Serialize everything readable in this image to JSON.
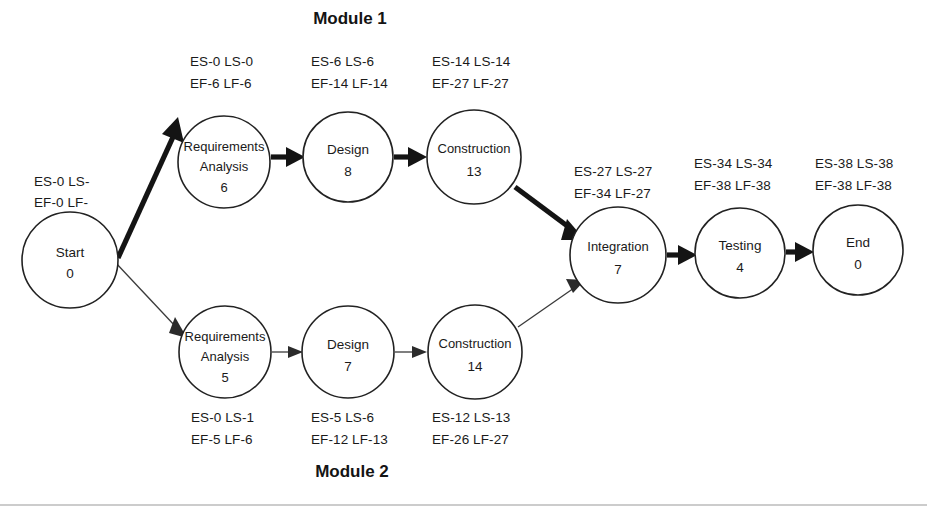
{
  "diagram": {
    "type": "pert-cpm-network",
    "module_titles": {
      "top": "Module 1",
      "bottom": "Module 2"
    },
    "nodes": [
      {
        "id": "start",
        "name": "Start",
        "duration": "0",
        "label_line1": "ES-0 LS-",
        "label_line2": "EF-0 LF-",
        "cx": 70,
        "cy": 260,
        "r": 48,
        "label_x": 34,
        "label_y": 182
      },
      {
        "id": "req-analysis-1",
        "name": "Requirements",
        "name2": "Analysis",
        "duration": "6",
        "label_line1": "ES-0 LS-0",
        "label_line2": "EF-6 LF-6",
        "cx": 224,
        "cy": 162,
        "r": 46,
        "label_x": 190,
        "label_y": 62
      },
      {
        "id": "design-1",
        "name": "Design",
        "duration": "8",
        "label_line1": "ES-6 LS-6",
        "label_line2": "EF-14 LF-14",
        "cx": 348,
        "cy": 157,
        "r": 45,
        "label_x": 311,
        "label_y": 62
      },
      {
        "id": "construction-1",
        "name": "Construction",
        "duration": "13",
        "label_line1": "ES-14 LS-14",
        "label_line2": "EF-27 LF-27",
        "cx": 474,
        "cy": 157,
        "r": 47,
        "label_x": 432,
        "label_y": 62
      },
      {
        "id": "req-analysis-2",
        "name": "Requirements",
        "name2": "Analysis",
        "duration": "5",
        "label_line1": "ES-0 LS-1",
        "label_line2": "EF-5 LF-6",
        "cx": 225,
        "cy": 352,
        "r": 46,
        "label_x": 191,
        "label_y": 418
      },
      {
        "id": "design-2",
        "name": "Design",
        "duration": "7",
        "label_line1": "ES-5 LS-6",
        "label_line2": "EF-12 LF-13",
        "cx": 348,
        "cy": 352,
        "r": 46,
        "label_x": 311,
        "label_y": 418
      },
      {
        "id": "construction-2",
        "name": "Construction",
        "duration": "14",
        "label_line1": "ES-12 LS-13",
        "label_line2": "EF-26 LF-27",
        "cx": 475,
        "cy": 352,
        "r": 47,
        "label_x": 432,
        "label_y": 418
      },
      {
        "id": "integration",
        "name": "Integration",
        "duration": "7",
        "label_line1": "ES-27 LS-27",
        "label_line2": "EF-34 LF-27",
        "cx": 618,
        "cy": 255,
        "r": 48,
        "label_x": 574,
        "label_y": 172
      },
      {
        "id": "testing",
        "name": "Testing",
        "duration": "4",
        "label_line1": "ES-34 LS-34",
        "label_line2": "EF-38 LF-38",
        "cx": 740,
        "cy": 253,
        "r": 45,
        "label_x": 694,
        "label_y": 164
      },
      {
        "id": "end",
        "name": "End",
        "duration": "0",
        "label_line1": "ES-38 LS-38",
        "label_line2": "EF-38 LF-38",
        "cx": 858,
        "cy": 250,
        "r": 45,
        "label_x": 815,
        "label_y": 164
      }
    ],
    "edges": [
      {
        "id": "start-to-req1",
        "from": "start",
        "to": "req-analysis-1",
        "critical": true
      },
      {
        "id": "req1-to-design1",
        "from": "req-analysis-1",
        "to": "design-1",
        "critical": true
      },
      {
        "id": "design1-to-construction1",
        "from": "design-1",
        "to": "construction-1",
        "critical": true
      },
      {
        "id": "construction1-to-integration",
        "from": "construction-1",
        "to": "integration",
        "critical": true
      },
      {
        "id": "start-to-req2",
        "from": "start",
        "to": "req-analysis-2",
        "critical": false
      },
      {
        "id": "req2-to-design2",
        "from": "req-analysis-2",
        "to": "design-2",
        "critical": false
      },
      {
        "id": "design2-to-construction2",
        "from": "design-2",
        "to": "construction-2",
        "critical": false
      },
      {
        "id": "construction2-to-integration",
        "from": "construction-2",
        "to": "integration",
        "critical": false
      },
      {
        "id": "integration-to-testing",
        "from": "integration",
        "to": "testing",
        "critical": true
      },
      {
        "id": "testing-to-end",
        "from": "testing",
        "to": "end",
        "critical": true
      }
    ],
    "colors": {
      "background": "#ffffff",
      "node_stroke": "#222222",
      "text": "#1a1a1a",
      "critical_edge": "#141414",
      "normal_edge": "#3a3a3a",
      "footer_rule": "#9a9a9a"
    }
  }
}
